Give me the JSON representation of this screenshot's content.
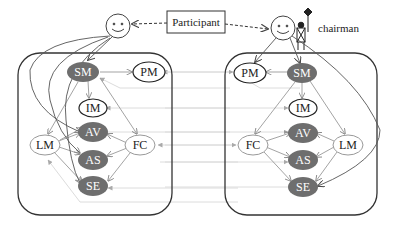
{
  "participant_box": {
    "label": "Participant"
  },
  "chairman_label": "chairman",
  "colors": {
    "dark_node": "#6e6e6e",
    "edge": "#9a9a9a",
    "outline": "#333333",
    "cross_link": "#d8d8d8"
  },
  "left_panel": {
    "nodes": {
      "SM": "SM",
      "PM": "PM",
      "IM": "IM",
      "AV": "AV",
      "AS": "AS",
      "SE": "SE",
      "LM": "LM",
      "FC": "FC"
    }
  },
  "right_panel": {
    "nodes": {
      "SM": "SM",
      "PM": "PM",
      "IM": "IM",
      "AV": "AV",
      "AS": "AS",
      "SE": "SE",
      "LM": "LM",
      "FC": "FC"
    }
  }
}
